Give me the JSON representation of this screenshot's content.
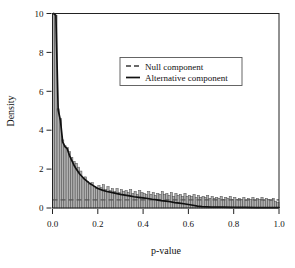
{
  "chart_data": {
    "type": "bar",
    "title": "",
    "subtitle": "",
    "xlabel": "p-value",
    "ylabel": "Density",
    "xlim": [
      0.0,
      1.0
    ],
    "ylim": [
      0.0,
      10.0
    ],
    "grid": false,
    "legend_position": "upper-center-right",
    "xticks": [
      0.0,
      0.2,
      0.4,
      0.6,
      0.8,
      1.0
    ],
    "xtick_labels": [
      "0.0",
      "0.2",
      "0.4",
      "0.6",
      "0.8",
      "1.0"
    ],
    "yticks": [
      0,
      2,
      4,
      6,
      8,
      10
    ],
    "ytick_labels": [
      "0",
      "2",
      "4",
      "6",
      "8",
      "10"
    ],
    "bin_width": 0.01,
    "categories": [
      0.005,
      0.015,
      0.025,
      0.035,
      0.045,
      0.055,
      0.065,
      0.075,
      0.085,
      0.095,
      0.105,
      0.115,
      0.125,
      0.135,
      0.145,
      0.155,
      0.165,
      0.175,
      0.185,
      0.195,
      0.205,
      0.215,
      0.225,
      0.235,
      0.245,
      0.255,
      0.265,
      0.275,
      0.285,
      0.295,
      0.305,
      0.315,
      0.325,
      0.335,
      0.345,
      0.355,
      0.365,
      0.375,
      0.385,
      0.395,
      0.405,
      0.415,
      0.425,
      0.435,
      0.445,
      0.455,
      0.465,
      0.475,
      0.485,
      0.495,
      0.505,
      0.515,
      0.525,
      0.535,
      0.545,
      0.555,
      0.565,
      0.575,
      0.585,
      0.595,
      0.605,
      0.615,
      0.625,
      0.635,
      0.645,
      0.655,
      0.665,
      0.675,
      0.685,
      0.695,
      0.705,
      0.715,
      0.725,
      0.735,
      0.745,
      0.755,
      0.765,
      0.775,
      0.785,
      0.795,
      0.805,
      0.815,
      0.825,
      0.835,
      0.845,
      0.855,
      0.865,
      0.875,
      0.885,
      0.895,
      0.905,
      0.915,
      0.925,
      0.935,
      0.945,
      0.955,
      0.965,
      0.975,
      0.985,
      0.995
    ],
    "values": [
      10.4,
      9.9,
      5.1,
      4.6,
      3.5,
      3.2,
      3.1,
      2.9,
      2.6,
      2.4,
      2.3,
      2.1,
      1.9,
      1.5,
      1.6,
      1.35,
      1.2,
      1.3,
      1.1,
      1.0,
      1.15,
      1.05,
      1.2,
      0.95,
      1.1,
      0.9,
      1.0,
      0.85,
      1.0,
      0.8,
      0.95,
      0.85,
      0.9,
      0.8,
      0.95,
      0.75,
      0.85,
      0.7,
      0.9,
      0.8,
      0.75,
      0.7,
      0.85,
      0.7,
      0.8,
      0.65,
      0.75,
      0.7,
      0.85,
      0.7,
      0.75,
      0.65,
      0.8,
      0.6,
      0.75,
      0.65,
      0.7,
      0.6,
      0.75,
      0.6,
      0.65,
      0.6,
      0.7,
      0.55,
      0.65,
      0.55,
      0.6,
      0.55,
      0.65,
      0.5,
      0.6,
      0.5,
      0.55,
      0.5,
      0.6,
      0.45,
      0.55,
      0.5,
      0.6,
      0.45,
      0.55,
      0.45,
      0.5,
      0.45,
      0.55,
      0.4,
      0.5,
      0.45,
      0.55,
      0.4,
      0.5,
      0.45,
      0.55,
      0.4,
      0.5,
      0.45,
      0.4,
      0.5,
      0.35,
      0.3
    ],
    "series": [
      {
        "name": "Null component",
        "style": "dashed",
        "x": [
          0.0,
          1.0
        ],
        "values": [
          0.42,
          0.42
        ]
      },
      {
        "name": "Alternative component",
        "style": "solid",
        "x": [
          0.005,
          0.015,
          0.025,
          0.035,
          0.045,
          0.055,
          0.065,
          0.075,
          0.085,
          0.095,
          0.105,
          0.12,
          0.14,
          0.16,
          0.18,
          0.2,
          0.22,
          0.24,
          0.26,
          0.28,
          0.3,
          0.32,
          0.34,
          0.36,
          0.38,
          0.4,
          0.42,
          0.44,
          0.46,
          0.48,
          0.5,
          0.52,
          0.54,
          0.56,
          0.58,
          0.6,
          0.62,
          0.64,
          0.66,
          0.7,
          0.75,
          0.8,
          0.85,
          0.9,
          0.95,
          1.0
        ],
        "values": [
          10.4,
          9.9,
          5.05,
          4.5,
          3.4,
          3.15,
          3.05,
          2.7,
          2.45,
          2.2,
          2.0,
          1.75,
          1.5,
          1.3,
          1.15,
          1.0,
          0.92,
          0.85,
          0.8,
          0.75,
          0.7,
          0.66,
          0.62,
          0.58,
          0.55,
          0.52,
          0.49,
          0.45,
          0.42,
          0.38,
          0.35,
          0.32,
          0.28,
          0.25,
          0.22,
          0.18,
          0.14,
          0.1,
          0.07,
          0.05,
          0.04,
          0.03,
          0.03,
          0.02,
          0.02,
          0.02
        ]
      }
    ],
    "colors": {
      "bar_fill": "#b0b0b0",
      "bar_edge": "#4a4a4a",
      "curve": "#101010",
      "null_line": "#555555",
      "frame": "#222222",
      "background": "#ffffff"
    }
  },
  "legend": {
    "entries": [
      {
        "label": "Null component",
        "style": "dashed"
      },
      {
        "label": "Alternative component",
        "style": "solid"
      }
    ]
  },
  "axes": {
    "x_title": "p-value",
    "y_title": "Density"
  }
}
